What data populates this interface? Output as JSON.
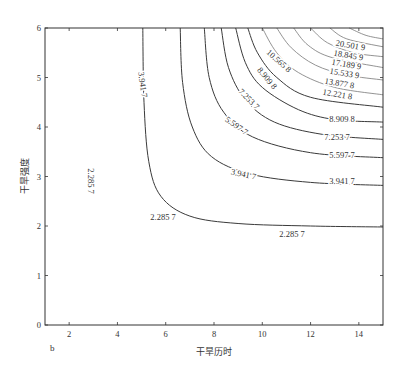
{
  "chart_data": {
    "type": "contour",
    "title": "",
    "panel_label": "b",
    "xlabel": "干旱历时",
    "ylabel": "干旱强度",
    "xlim": [
      1,
      15
    ],
    "ylim": [
      0,
      6
    ],
    "xticks": [
      2,
      4,
      6,
      8,
      10,
      12,
      14
    ],
    "yticks": [
      0,
      1,
      2,
      3,
      4,
      5,
      6
    ],
    "grid": false,
    "legend": null,
    "contour_levels": [
      2.2857,
      3.9417,
      5.5977,
      7.2537,
      8.9098,
      10.5658,
      12.2218,
      13.8778,
      15.5339,
      17.1899,
      18.8459,
      20.5019
    ],
    "contour_labels": [
      "2.285 7",
      "3.941 7",
      "5.597 7",
      "7.253 7",
      "8.909 8",
      "10.565 8",
      "12.221 8",
      "13.877 8",
      "15.533 9",
      "17.189 9",
      "18.845 9",
      "20.501 9"
    ],
    "contours": [
      {
        "level": "2.285 7",
        "points": [
          [
            5.05,
            6
          ],
          [
            5.1,
            4.5
          ],
          [
            5.3,
            3.3
          ],
          [
            5.8,
            2.6
          ],
          [
            7,
            2.2
          ],
          [
            9,
            2.05
          ],
          [
            12,
            2.0
          ],
          [
            15,
            1.98
          ]
        ]
      },
      {
        "level": "3.941 7",
        "points": [
          [
            6.6,
            6
          ],
          [
            6.7,
            4.9
          ],
          [
            7.1,
            4.0
          ],
          [
            7.9,
            3.4
          ],
          [
            9.5,
            3.05
          ],
          [
            12,
            2.88
          ],
          [
            15,
            2.82
          ]
        ]
      },
      {
        "level": "5.597 7",
        "points": [
          [
            7.6,
            6
          ],
          [
            7.8,
            5.0
          ],
          [
            8.4,
            4.3
          ],
          [
            9.6,
            3.8
          ],
          [
            12,
            3.48
          ],
          [
            15,
            3.38
          ]
        ]
      },
      {
        "level": "7.253 7",
        "points": [
          [
            8.3,
            6
          ],
          [
            8.6,
            5.2
          ],
          [
            9.3,
            4.55
          ],
          [
            10.5,
            4.1
          ],
          [
            12.5,
            3.85
          ],
          [
            15,
            3.75
          ]
        ]
      },
      {
        "level": "8.909 8",
        "points": [
          [
            8.9,
            6
          ],
          [
            9.3,
            5.3
          ],
          [
            10.0,
            4.8
          ],
          [
            11.5,
            4.35
          ],
          [
            13,
            4.15
          ],
          [
            15,
            4.1
          ]
        ]
      },
      {
        "level": "10.565 8",
        "points": [
          [
            9.4,
            6
          ],
          [
            9.8,
            5.5
          ],
          [
            10.6,
            5.0
          ],
          [
            12,
            4.6
          ],
          [
            15,
            4.4
          ]
        ]
      },
      {
        "level": "12.221 8",
        "points": [
          [
            10.0,
            6
          ],
          [
            10.6,
            5.5
          ],
          [
            11.5,
            5.1
          ],
          [
            13,
            4.8
          ],
          [
            15,
            4.65
          ]
        ]
      },
      {
        "level": "13.877 8",
        "points": [
          [
            10.6,
            6
          ],
          [
            11.2,
            5.6
          ],
          [
            12.2,
            5.25
          ],
          [
            13.5,
            5.05
          ],
          [
            15,
            4.95
          ]
        ]
      },
      {
        "level": "15.533 9",
        "points": [
          [
            11.3,
            6
          ],
          [
            11.9,
            5.65
          ],
          [
            12.9,
            5.4
          ],
          [
            15,
            5.2
          ]
        ]
      },
      {
        "level": "17.189 9",
        "points": [
          [
            12.0,
            6
          ],
          [
            12.7,
            5.7
          ],
          [
            13.8,
            5.5
          ],
          [
            15,
            5.42
          ]
        ]
      },
      {
        "level": "18.845 9",
        "points": [
          [
            12.8,
            6
          ],
          [
            13.5,
            5.78
          ],
          [
            15,
            5.62
          ]
        ]
      },
      {
        "level": "20.501 9",
        "points": [
          [
            13.6,
            6
          ],
          [
            14.3,
            5.85
          ],
          [
            15,
            5.78
          ]
        ]
      }
    ]
  }
}
